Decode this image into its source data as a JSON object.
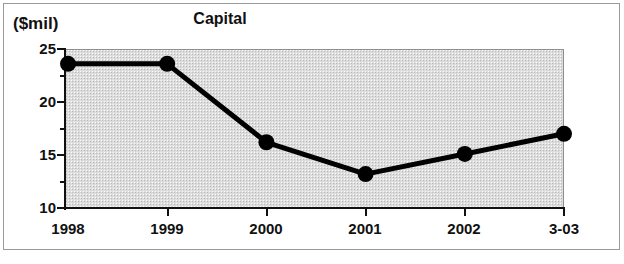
{
  "figure": {
    "unit_label": "($mil)",
    "title": "Capital"
  },
  "chart_data": {
    "type": "line",
    "title": "Capital",
    "subtitle": "",
    "xlabel": "",
    "ylabel": "($mil)",
    "unit_label": "($mil)",
    "categories": [
      "1998",
      "1999",
      "2000",
      "2001",
      "2002",
      "3-03"
    ],
    "values": [
      23.6,
      23.6,
      16.2,
      13.2,
      15.1,
      17.0
    ],
    "series": [
      {
        "name": "Capital",
        "values": [
          23.6,
          23.6,
          16.2,
          13.2,
          15.1,
          17.0
        ]
      }
    ],
    "ylim": [
      10,
      25
    ],
    "ytick_labels": [
      "25",
      "20",
      "15",
      "10"
    ],
    "ytick_values": [
      25,
      20,
      15,
      10
    ],
    "yminor_tick_values": [
      22.5,
      17.5,
      12.5
    ],
    "xtick_labels": [
      "1998",
      "1999",
      "2000",
      "2001",
      "2002",
      "3-03"
    ],
    "grid": false,
    "legend": "none",
    "marker": "filled-circle",
    "line_color": "#000000",
    "marker_color": "#000000",
    "plot_background_color": "#dcdcdc",
    "page_background_color": "#ffffff"
  },
  "axis": {
    "y_labels": [
      {
        "text": "25",
        "value": 25
      },
      {
        "text": "20",
        "value": 20
      },
      {
        "text": "15",
        "value": 15
      },
      {
        "text": "10",
        "value": 10
      }
    ],
    "x_labels": [
      {
        "text": "1998"
      },
      {
        "text": "1999"
      },
      {
        "text": "2000"
      },
      {
        "text": "2001"
      },
      {
        "text": "2002"
      },
      {
        "text": "3-03"
      }
    ]
  }
}
